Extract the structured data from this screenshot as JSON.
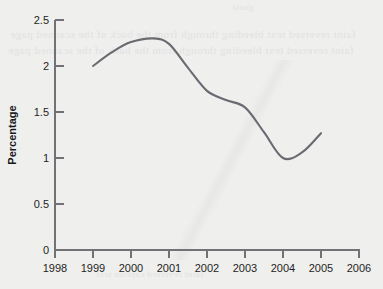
{
  "page": {
    "background_color": "#efefee",
    "ghost_text": [
      "ghost",
      "faint reversed text bleeding through from the back of the scanned page",
      "faint reversed text bleeding through from the back of the scanned page",
      "faint reversed caption text"
    ]
  },
  "chart_data": {
    "type": "line",
    "title": "",
    "subtitle": "",
    "xlabel": "",
    "ylabel": "Percentage",
    "xlim": [
      1998,
      2006
    ],
    "ylim": [
      0,
      2.5
    ],
    "grid": false,
    "legend": null,
    "legend_position": "none",
    "line_color": "#6a6a70",
    "axis_color": "#717176",
    "x_ticks": [
      1998,
      1999,
      2000,
      2001,
      2002,
      2003,
      2004,
      2005,
      2006
    ],
    "x_tick_labels": [
      "1998",
      "1999",
      "2000",
      "2001",
      "2002",
      "2003",
      "2004",
      "2005",
      "2006"
    ],
    "y_ticks": [
      0,
      0.5,
      1,
      1.5,
      2,
      2.5
    ],
    "y_tick_labels": [
      "0",
      "0.5",
      "1",
      "1.5",
      "2",
      "2.5"
    ],
    "x": [
      1999,
      1999.5,
      2000,
      2000.6,
      2001,
      2001.5,
      2002,
      2002.5,
      2003,
      2003.5,
      2004,
      2004.5,
      2005
    ],
    "values": [
      2.0,
      2.15,
      2.26,
      2.3,
      2.24,
      1.98,
      1.73,
      1.63,
      1.55,
      1.28,
      1.0,
      1.06,
      1.27
    ],
    "series": [
      {
        "name": "Percentage",
        "color": "#6a6a70",
        "values": [
          2.0,
          2.15,
          2.26,
          2.3,
          2.24,
          1.98,
          1.73,
          1.63,
          1.55,
          1.28,
          1.0,
          1.06,
          1.27
        ]
      }
    ],
    "annotations": []
  }
}
